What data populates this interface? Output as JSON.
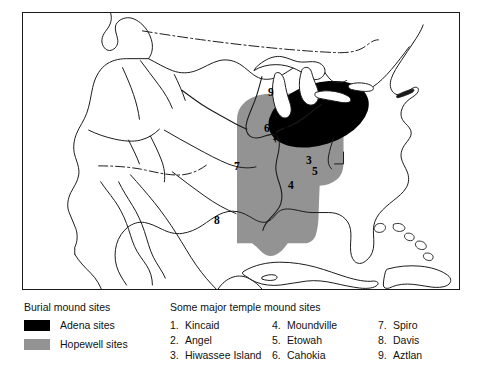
{
  "figure": {
    "map_kind": "north-america-outline"
  },
  "map": {
    "regions": [
      {
        "id": "adena",
        "label": "Adena sites",
        "color": "#000000"
      },
      {
        "id": "hopewell",
        "label": "Hopewell sites",
        "color": "#939393"
      }
    ],
    "border_style": "dash-dot",
    "frame_color": "#1a1a1a",
    "site_markers": [
      {
        "num": "9",
        "name": "Aztlan",
        "x": 268,
        "y": 86
      },
      {
        "num": "6",
        "name": "Cahokia",
        "x": 264,
        "y": 121
      },
      {
        "num": "1",
        "name": "Kincaid",
        "x": 272,
        "y": 128
      },
      {
        "num": "2",
        "name": "Angel",
        "x": 284,
        "y": 119
      },
      {
        "num": "7",
        "name": "Spiro",
        "x": 234,
        "y": 158
      },
      {
        "num": "3",
        "name": "Hiwassee Island",
        "x": 306,
        "y": 152
      },
      {
        "num": "5",
        "name": "Etowah",
        "x": 312,
        "y": 163
      },
      {
        "num": "4",
        "name": "Moundville",
        "x": 288,
        "y": 177
      },
      {
        "num": "8",
        "name": "Davis",
        "x": 214,
        "y": 212
      }
    ]
  },
  "legend": {
    "burial": {
      "heading": "Burial mound sites",
      "entries": [
        {
          "label": "Adena sites",
          "color": "#000000"
        },
        {
          "label": "Hopewell sites",
          "color": "#939393"
        }
      ]
    },
    "temple": {
      "heading": "Some major temple mound sites",
      "columns": [
        [
          {
            "num": "1.",
            "name": "Kincaid"
          },
          {
            "num": "2.",
            "name": "Angel"
          },
          {
            "num": "3.",
            "name": "Hiwassee Island"
          }
        ],
        [
          {
            "num": "4.",
            "name": "Moundville"
          },
          {
            "num": "5.",
            "name": "Etowah"
          },
          {
            "num": "6.",
            "name": "Cahokia"
          }
        ],
        [
          {
            "num": "7.",
            "name": "Spiro"
          },
          {
            "num": "8.",
            "name": "Davis"
          },
          {
            "num": "9.",
            "name": "Aztlan"
          }
        ]
      ]
    }
  }
}
